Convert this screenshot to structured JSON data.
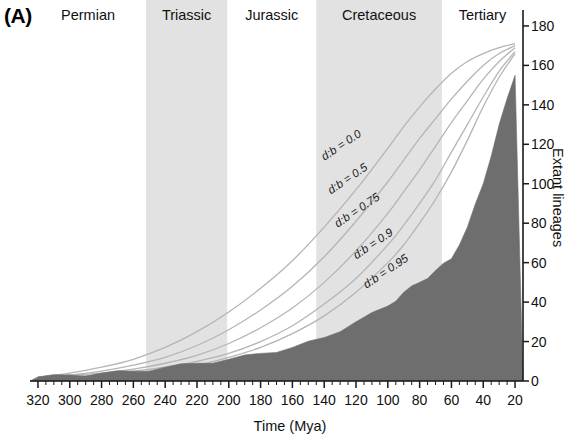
{
  "panel": {
    "label": "(A)"
  },
  "axes": {
    "x": {
      "title": "Time (Mya)",
      "ticks": [
        320,
        300,
        280,
        260,
        240,
        220,
        200,
        180,
        160,
        140,
        120,
        100,
        80,
        60,
        40,
        20
      ],
      "range": [
        325,
        15
      ],
      "minor_step": 5
    },
    "y": {
      "title": "Extant lineages",
      "ticks": [
        0,
        20,
        40,
        60,
        80,
        100,
        120,
        140,
        160,
        180
      ],
      "range": [
        0,
        182
      ],
      "position": "right"
    }
  },
  "periods": [
    {
      "name": "Permian",
      "start": 325,
      "end": 252,
      "shaded": false
    },
    {
      "name": "Triassic",
      "start": 252,
      "end": 201,
      "shaded": true
    },
    {
      "name": "Jurassic",
      "start": 201,
      "end": 145,
      "shaded": false
    },
    {
      "name": "Cretaceous",
      "start": 145,
      "end": 66,
      "shaded": true
    },
    {
      "name": "Tertiary",
      "start": 66,
      "end": 15,
      "shaded": false
    }
  ],
  "colors": {
    "band_shade": "#e2e2e2",
    "area_fill": "#6e6e6e",
    "curve_line": "#b5b5b5",
    "axis": "#1a1a1a",
    "background": "#ffffff"
  },
  "chart_data": {
    "type": "area",
    "title": "",
    "xlabel": "Time (Mya)",
    "ylabel": "Extant lineages",
    "xlim": [
      325,
      15
    ],
    "ylim": [
      0,
      182
    ],
    "grid": false,
    "legend": "inline-curve-labels",
    "x": [
      320,
      300,
      280,
      260,
      240,
      220,
      200,
      180,
      160,
      140,
      120,
      100,
      90,
      80,
      70,
      60,
      50,
      40,
      30,
      20
    ],
    "series": [
      {
        "name": "observed lineages-through-time",
        "kind": "filled-area",
        "label": "",
        "values": [
          2,
          3,
          4,
          5,
          7,
          9,
          11,
          14,
          17,
          22,
          30,
          38,
          45,
          50,
          56,
          62,
          78,
          100,
          130,
          155
        ]
      },
      {
        "name": "d:b = 0.0",
        "kind": "line",
        "label": "d:b = 0.0",
        "values": [
          2,
          4,
          7,
          11,
          17,
          25,
          35,
          47,
          61,
          78,
          97,
          118,
          129,
          139,
          148,
          156,
          162,
          166,
          169,
          171
        ]
      },
      {
        "name": "d:b = 0.5",
        "kind": "line",
        "label": "d:b = 0.5",
        "values": [
          2,
          3,
          5,
          8,
          12,
          18,
          26,
          36,
          48,
          63,
          81,
          101,
          112,
          123,
          133,
          143,
          152,
          160,
          166,
          170
        ]
      },
      {
        "name": "d:b = 0.75",
        "kind": "line",
        "label": "d:b = 0.75",
        "values": [
          2,
          3,
          4,
          6,
          9,
          13,
          19,
          27,
          37,
          50,
          66,
          85,
          96,
          107,
          119,
          131,
          142,
          153,
          162,
          169
        ]
      },
      {
        "name": "d:b = 0.9",
        "kind": "line",
        "label": "d:b = 0.9",
        "values": [
          2,
          2,
          3,
          5,
          7,
          10,
          14,
          20,
          28,
          39,
          52,
          69,
          79,
          90,
          102,
          116,
          130,
          144,
          157,
          167
        ]
      },
      {
        "name": "d:b = 0.95",
        "kind": "line",
        "label": "d:b = 0.95",
        "values": [
          1,
          2,
          3,
          4,
          6,
          8,
          12,
          17,
          24,
          33,
          45,
          60,
          69,
          80,
          92,
          106,
          122,
          139,
          154,
          166
        ]
      }
    ],
    "curve_labels": [
      {
        "text": "d:b = 0.0",
        "x": 128,
        "y": 118
      },
      {
        "text": "d:b = 0.5",
        "x": 124,
        "y": 101
      },
      {
        "text": "d:b = 0.75",
        "x": 118,
        "y": 85
      },
      {
        "text": "d:b = 0.9",
        "x": 108,
        "y": 68
      },
      {
        "text": "d:b = 0.95",
        "x": 100,
        "y": 54
      }
    ]
  }
}
